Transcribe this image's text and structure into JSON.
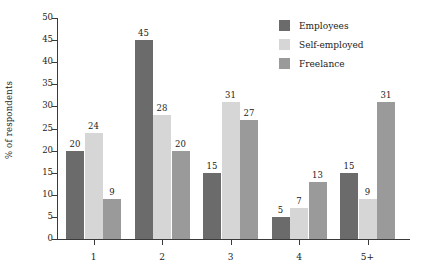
{
  "chart_data": {
    "type": "bar",
    "title": "",
    "subtitle": "",
    "xlabel": "",
    "ylabel": "% of respondents",
    "categories": [
      "1",
      "2",
      "3",
      "4",
      "5+"
    ],
    "series": [
      {
        "name": "Employees",
        "color": "#6b6b6b",
        "values": [
          20,
          45,
          15,
          5,
          15
        ]
      },
      {
        "name": "Self-employed",
        "color": "#d6d6d6",
        "values": [
          24,
          28,
          31,
          7,
          9
        ]
      },
      {
        "name": "Freelance",
        "color": "#9a9a9a",
        "values": [
          9,
          20,
          27,
          13,
          31
        ]
      }
    ],
    "ylim": [
      0,
      50
    ],
    "ytick_step": 5,
    "yticks": [
      0,
      5,
      10,
      15,
      20,
      25,
      30,
      35,
      40,
      45,
      50
    ],
    "grid": false,
    "legend_position": "top-right",
    "value_labels": true,
    "annotations": []
  }
}
